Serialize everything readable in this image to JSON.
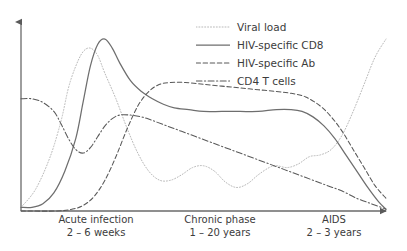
{
  "chart_data": {
    "type": "line",
    "title": "",
    "xlabel": "",
    "ylabel": "",
    "grid": false,
    "legend_position": "top-right",
    "xlim": [
      0,
      100
    ],
    "ylim": [
      0,
      100
    ],
    "axis_style": "arrowed L-shaped axes, no tick marks, no tick labels",
    "phases": [
      {
        "name": "Acute infection",
        "duration": "2 – 6 weeks",
        "x_start": 0,
        "x_end": 33
      },
      {
        "name": "Chronic phase",
        "duration": "1 – 20 years",
        "x_start": 33,
        "x_end": 70
      },
      {
        "name": "AIDS",
        "duration": "2 – 3 years",
        "x_start": 70,
        "x_end": 100
      }
    ],
    "series": [
      {
        "name": "Viral load",
        "style": "dotted",
        "color": "#b9b9b9",
        "points": [
          [
            0,
            2
          ],
          [
            4,
            12
          ],
          [
            8,
            30
          ],
          [
            11,
            50
          ],
          [
            13,
            68
          ],
          [
            15,
            80
          ],
          [
            17,
            88
          ],
          [
            19,
            90
          ],
          [
            21,
            86
          ],
          [
            23,
            76
          ],
          [
            26,
            62
          ],
          [
            29,
            46
          ],
          [
            32,
            32
          ],
          [
            35,
            22
          ],
          [
            38,
            17
          ],
          [
            41,
            17
          ],
          [
            44,
            20
          ],
          [
            47,
            24
          ],
          [
            50,
            25
          ],
          [
            53,
            22
          ],
          [
            56,
            16
          ],
          [
            59,
            13
          ],
          [
            62,
            15
          ],
          [
            65,
            20
          ],
          [
            68,
            24
          ],
          [
            70,
            25
          ],
          [
            73,
            24
          ],
          [
            76,
            26
          ],
          [
            79,
            30
          ],
          [
            82,
            31
          ],
          [
            85,
            34
          ],
          [
            88,
            42
          ],
          [
            91,
            55
          ],
          [
            94,
            70
          ],
          [
            97,
            85
          ],
          [
            100,
            95
          ]
        ]
      },
      {
        "name": "HIV-specific CD8",
        "style": "solid",
        "color": "#6e6e6e",
        "points": [
          [
            0,
            2
          ],
          [
            3,
            2
          ],
          [
            6,
            4
          ],
          [
            9,
            10
          ],
          [
            12,
            22
          ],
          [
            15,
            40
          ],
          [
            17,
            60
          ],
          [
            19,
            80
          ],
          [
            21,
            92
          ],
          [
            23,
            95
          ],
          [
            25,
            90
          ],
          [
            27,
            82
          ],
          [
            30,
            72
          ],
          [
            33,
            66
          ],
          [
            36,
            62
          ],
          [
            39,
            59
          ],
          [
            42,
            57
          ],
          [
            46,
            56
          ],
          [
            50,
            55
          ],
          [
            55,
            55
          ],
          [
            60,
            55
          ],
          [
            65,
            55
          ],
          [
            70,
            56
          ],
          [
            74,
            56
          ],
          [
            77,
            55
          ],
          [
            80,
            52
          ],
          [
            83,
            47
          ],
          [
            86,
            40
          ],
          [
            89,
            31
          ],
          [
            92,
            22
          ],
          [
            95,
            13
          ],
          [
            98,
            5
          ],
          [
            100,
            1
          ]
        ]
      },
      {
        "name": "HIV-specific Ab",
        "style": "dashed",
        "color": "#585858",
        "points": [
          [
            0,
            0
          ],
          [
            10,
            0
          ],
          [
            14,
            1
          ],
          [
            17,
            3
          ],
          [
            20,
            8
          ],
          [
            23,
            17
          ],
          [
            26,
            30
          ],
          [
            29,
            45
          ],
          [
            32,
            58
          ],
          [
            35,
            66
          ],
          [
            38,
            70
          ],
          [
            41,
            71
          ],
          [
            45,
            71
          ],
          [
            50,
            70
          ],
          [
            55,
            69
          ],
          [
            60,
            68
          ],
          [
            65,
            67
          ],
          [
            70,
            66
          ],
          [
            74,
            65
          ],
          [
            78,
            63
          ],
          [
            82,
            58
          ],
          [
            85,
            52
          ],
          [
            88,
            44
          ],
          [
            91,
            34
          ],
          [
            94,
            24
          ],
          [
            97,
            14
          ],
          [
            100,
            7
          ]
        ]
      },
      {
        "name": "CD4 T cells",
        "style": "dash-dot",
        "color": "#595959",
        "points": [
          [
            0,
            62
          ],
          [
            3,
            62
          ],
          [
            6,
            60
          ],
          [
            9,
            55
          ],
          [
            11,
            48
          ],
          [
            13,
            40
          ],
          [
            15,
            34
          ],
          [
            17,
            32
          ],
          [
            19,
            35
          ],
          [
            21,
            41
          ],
          [
            23,
            47
          ],
          [
            25,
            51
          ],
          [
            27,
            53
          ],
          [
            30,
            53
          ],
          [
            33,
            52
          ],
          [
            36,
            50
          ],
          [
            40,
            47
          ],
          [
            44,
            44
          ],
          [
            48,
            41
          ],
          [
            52,
            38
          ],
          [
            56,
            35
          ],
          [
            60,
            32
          ],
          [
            64,
            29
          ],
          [
            68,
            26
          ],
          [
            72,
            23
          ],
          [
            76,
            20
          ],
          [
            80,
            17
          ],
          [
            84,
            14
          ],
          [
            88,
            11
          ],
          [
            92,
            7
          ],
          [
            96,
            4
          ],
          [
            100,
            1
          ]
        ]
      }
    ]
  },
  "legend": {
    "items": [
      {
        "label": "Viral load"
      },
      {
        "label": "HIV-specific CD8"
      },
      {
        "label": "HIV-specific Ab"
      },
      {
        "label": "CD4 T cells"
      }
    ]
  }
}
